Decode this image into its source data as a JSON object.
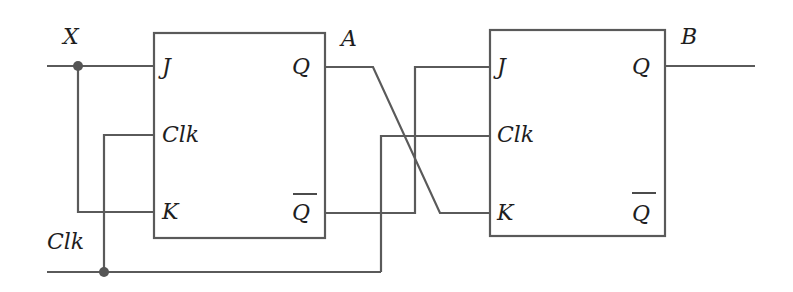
{
  "diagram": {
    "type": "circuit",
    "colors": {
      "wire": "#5a5a5a",
      "label": "#1e1e1e",
      "background": "#ffffff"
    },
    "inputs": [
      {
        "id": "X",
        "label": "X"
      },
      {
        "id": "Clk",
        "label": "Clk"
      }
    ],
    "outputs": [
      {
        "id": "A",
        "label": "A"
      },
      {
        "id": "B",
        "label": "B"
      }
    ],
    "flipflops": [
      {
        "id": "ff1",
        "type": "JK",
        "pins": {
          "j": "J",
          "clk": "Clk",
          "k": "K",
          "q": "Q",
          "qbar": "Q"
        }
      },
      {
        "id": "ff2",
        "type": "JK",
        "pins": {
          "j": "J",
          "clk": "Clk",
          "k": "K",
          "q": "Q",
          "qbar": "Q"
        }
      }
    ],
    "connections": [
      "X -> FF1.J",
      "X -> FF1.K",
      "Clk -> FF1.Clk",
      "Clk -> FF2.Clk",
      "FF1.Q (A) -> FF2.K",
      "FF1.Qbar -> FF2.J",
      "FF2.Q -> B"
    ]
  }
}
